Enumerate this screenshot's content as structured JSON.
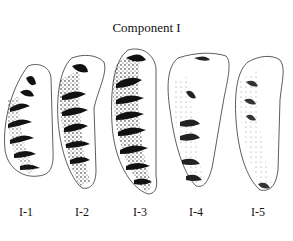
{
  "figure": {
    "title": "Component I",
    "specimens": [
      {
        "label": "I-1",
        "shading": "medium"
      },
      {
        "label": "I-2",
        "shading": "medium"
      },
      {
        "label": "I-3",
        "shading": "dark"
      },
      {
        "label": "I-4",
        "shading": "light"
      },
      {
        "label": "I-5",
        "shading": "very-light"
      }
    ]
  }
}
